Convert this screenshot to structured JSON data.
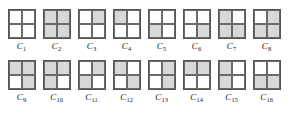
{
  "figure": {
    "name": "configuration-grid-figure",
    "colors": {
      "shaded_fill": "#d8d8d8",
      "hatch_line": "#787878",
      "outer_border": "#555555",
      "inner_border": "#6a6a6a",
      "label_color": "#1a1a1a",
      "background": "#ffffff"
    },
    "label_prefix": "C",
    "rows": [
      {
        "row_index": 1,
        "cells": [
          {
            "label_prefix": "C",
            "label_index": "1",
            "quadrants": [
              0,
              0,
              0,
              0
            ]
          },
          {
            "label_prefix": "C",
            "label_index": "2",
            "quadrants": [
              1,
              1,
              1,
              1
            ]
          },
          {
            "label_prefix": "C",
            "label_index": "3",
            "quadrants": [
              0,
              1,
              0,
              0
            ]
          },
          {
            "label_prefix": "C",
            "label_index": "4",
            "quadrants": [
              1,
              0,
              0,
              0
            ]
          },
          {
            "label_prefix": "C",
            "label_index": "5",
            "quadrants": [
              0,
              0,
              1,
              0
            ]
          },
          {
            "label_prefix": "C",
            "label_index": "6",
            "quadrants": [
              0,
              0,
              0,
              1
            ]
          },
          {
            "label_prefix": "C",
            "label_index": "7",
            "quadrants": [
              1,
              0,
              1,
              1
            ]
          },
          {
            "label_prefix": "C",
            "label_index": "8",
            "quadrants": [
              0,
              1,
              1,
              1
            ]
          }
        ]
      },
      {
        "row_index": 2,
        "cells": [
          {
            "label_prefix": "C",
            "label_index": "9",
            "quadrants": [
              1,
              1,
              0,
              1
            ]
          },
          {
            "label_prefix": "C",
            "label_index": "10",
            "quadrants": [
              1,
              1,
              1,
              0
            ]
          },
          {
            "label_prefix": "C",
            "label_index": "11",
            "quadrants": [
              0,
              1,
              1,
              0
            ]
          },
          {
            "label_prefix": "C",
            "label_index": "12",
            "quadrants": [
              1,
              0,
              0,
              1
            ]
          },
          {
            "label_prefix": "C",
            "label_index": "13",
            "quadrants": [
              0,
              1,
              0,
              1
            ]
          },
          {
            "label_prefix": "C",
            "label_index": "14",
            "quadrants": [
              1,
              1,
              0,
              0
            ]
          },
          {
            "label_prefix": "C",
            "label_index": "15",
            "quadrants": [
              1,
              0,
              1,
              0
            ]
          },
          {
            "label_prefix": "C",
            "label_index": "16",
            "quadrants": [
              0,
              0,
              1,
              1
            ]
          }
        ]
      }
    ]
  }
}
